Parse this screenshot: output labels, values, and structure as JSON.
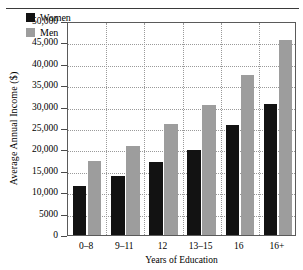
{
  "figure": {
    "y_axis_title": "Average Annual Income ($)",
    "x_axis_title": "Years of Education"
  },
  "legend": {
    "entries": [
      {
        "label": "Women",
        "color": "#121212",
        "swatch": "legend-swatch-women"
      },
      {
        "label": "Men",
        "color": "#9d9d9d",
        "swatch": "legend-swatch-men"
      }
    ]
  },
  "axis": {
    "y_ticks": [
      {
        "label": "50,000",
        "value": 50000
      },
      {
        "label": "45,000",
        "value": 45000
      },
      {
        "label": "40,000",
        "value": 40000
      },
      {
        "label": "35,000",
        "value": 35000
      },
      {
        "label": "30,000",
        "value": 30000
      },
      {
        "label": "25,000",
        "value": 25000
      },
      {
        "label": "20,000",
        "value": 20000
      },
      {
        "label": "15,000",
        "value": 15000
      },
      {
        "label": "10,000",
        "value": 10000
      },
      {
        "label": "5000",
        "value": 5000
      },
      {
        "label": "0",
        "value": 0
      }
    ],
    "x_ticks": [
      "0–8",
      "9–11",
      "12",
      "13–15",
      "16",
      "16+"
    ]
  },
  "chart_data": {
    "type": "bar",
    "title": "",
    "xlabel": "Years of Education",
    "ylabel": "Average Annual Income ($)",
    "categories": [
      "0–8",
      "9–11",
      "12",
      "13–15",
      "16",
      "16+"
    ],
    "series": [
      {
        "name": "Women",
        "color": "#121212",
        "values": [
          11500,
          13800,
          17000,
          19800,
          25800,
          30600
        ]
      },
      {
        "name": "Men",
        "color": "#9d9d9d",
        "values": [
          17400,
          20700,
          25900,
          30300,
          37500,
          45500
        ]
      }
    ],
    "ylim": [
      0,
      50000
    ],
    "ytick_step": 5000,
    "grid": true,
    "grid_style": "dotted",
    "legend_position": "top-left-inside"
  }
}
